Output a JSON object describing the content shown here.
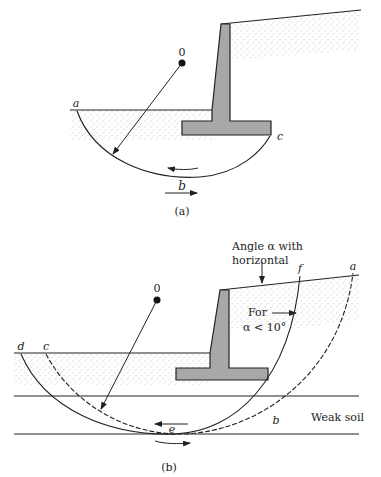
{
  "figure_a": {
    "caption": "(a)",
    "center_label": "0",
    "points": {
      "a": "a",
      "b": "b",
      "c": "c"
    }
  },
  "figure_b": {
    "caption": "(b)",
    "center_label": "0",
    "points": {
      "a": "a",
      "b": "b",
      "c": "c",
      "d": "d",
      "e": "e",
      "f": "f"
    },
    "annotation_angle_line1": "Angle α with",
    "annotation_angle_line2": "horizontal",
    "annotation_for_line1": "For",
    "annotation_for_line2": "α < 10°",
    "layer_label": "Weak soil"
  },
  "colors": {
    "wall": "#a8a8a8",
    "line": "#222222",
    "stipple": "#777777"
  }
}
